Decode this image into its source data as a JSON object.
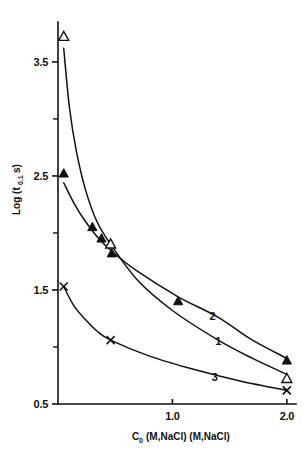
{
  "chart_data": {
    "type": "line",
    "title": "",
    "xlabel": "C₀ (M,NaCl) (M,NaCl)",
    "ylabel": "Log (t₀.₁ s)",
    "xlim": [
      0.0,
      2.08
    ],
    "ylim": [
      0.5,
      3.85
    ],
    "grid": false,
    "legend": "inline curve numbers",
    "x_ticks": [
      {
        "value": 1.0,
        "label": "1.0",
        "type": "major"
      },
      {
        "value": 2.0,
        "label": "2.0",
        "type": "major"
      }
    ],
    "y_ticks": [
      {
        "value": 3.5,
        "label": "3.5",
        "type": "major"
      },
      {
        "value": 3.0,
        "label": "",
        "type": "minor"
      },
      {
        "value": 2.5,
        "label": "2.5",
        "type": "major"
      },
      {
        "value": 2.0,
        "label": "",
        "type": "minor"
      },
      {
        "value": 1.5,
        "label": "1.5",
        "type": "major"
      },
      {
        "value": 1.0,
        "label": "",
        "type": "minor"
      },
      {
        "value": 0.5,
        "label": "0.5",
        "type": "major"
      }
    ],
    "series": [
      {
        "name": "1",
        "label": "1",
        "marker": "open-triangle",
        "label_position": {
          "x": 1.4,
          "y": 1.02
        },
        "points": [
          {
            "x": 0.05,
            "y": 3.72
          },
          {
            "x": 0.46,
            "y": 1.9
          },
          {
            "x": 2.0,
            "y": 0.72
          }
        ],
        "curve": [
          {
            "x": 0.05,
            "y": 3.62
          },
          {
            "x": 0.1,
            "y": 3.1
          },
          {
            "x": 0.16,
            "y": 2.72
          },
          {
            "x": 0.24,
            "y": 2.38
          },
          {
            "x": 0.34,
            "y": 2.1
          },
          {
            "x": 0.46,
            "y": 1.9
          },
          {
            "x": 0.7,
            "y": 1.58
          },
          {
            "x": 1.0,
            "y": 1.32
          },
          {
            "x": 1.4,
            "y": 1.06
          },
          {
            "x": 1.7,
            "y": 0.9
          },
          {
            "x": 2.0,
            "y": 0.76
          }
        ]
      },
      {
        "name": "2",
        "label": "2",
        "marker": "filled-triangle",
        "label_position": {
          "x": 1.35,
          "y": 1.24
        },
        "points": [
          {
            "x": 0.05,
            "y": 2.52
          },
          {
            "x": 0.3,
            "y": 2.05
          },
          {
            "x": 0.38,
            "y": 1.95
          },
          {
            "x": 0.47,
            "y": 1.82
          },
          {
            "x": 1.05,
            "y": 1.4
          },
          {
            "x": 2.0,
            "y": 0.88
          }
        ],
        "curve": [
          {
            "x": 0.05,
            "y": 2.44
          },
          {
            "x": 0.14,
            "y": 2.26
          },
          {
            "x": 0.24,
            "y": 2.1
          },
          {
            "x": 0.34,
            "y": 1.97
          },
          {
            "x": 0.47,
            "y": 1.84
          },
          {
            "x": 0.7,
            "y": 1.66
          },
          {
            "x": 1.05,
            "y": 1.44
          },
          {
            "x": 1.4,
            "y": 1.26
          },
          {
            "x": 1.7,
            "y": 1.06
          },
          {
            "x": 2.0,
            "y": 0.9
          }
        ]
      },
      {
        "name": "3",
        "label": "3",
        "marker": "cross",
        "label_position": {
          "x": 1.37,
          "y": 0.7
        },
        "points": [
          {
            "x": 0.05,
            "y": 1.53
          },
          {
            "x": 0.46,
            "y": 1.06
          },
          {
            "x": 2.0,
            "y": 0.62
          }
        ],
        "curve": [
          {
            "x": 0.05,
            "y": 1.53
          },
          {
            "x": 0.14,
            "y": 1.36
          },
          {
            "x": 0.24,
            "y": 1.24
          },
          {
            "x": 0.34,
            "y": 1.14
          },
          {
            "x": 0.46,
            "y": 1.06
          },
          {
            "x": 0.8,
            "y": 0.92
          },
          {
            "x": 1.2,
            "y": 0.8
          },
          {
            "x": 1.6,
            "y": 0.7
          },
          {
            "x": 2.0,
            "y": 0.62
          }
        ]
      }
    ]
  },
  "axis": {
    "y_title_main": "Log (t",
    "y_title_sub": "0.1",
    "y_title_tail": " s)",
    "x_title_main": "C",
    "x_title_sub": "0",
    "x_title_rest": "(M,NaCl) (M,NaCl)"
  }
}
